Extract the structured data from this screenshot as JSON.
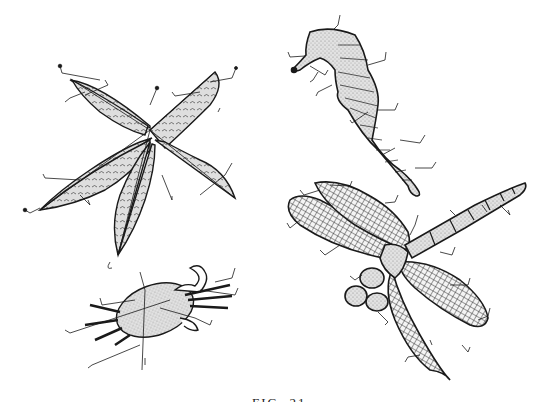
{
  "plate": {
    "description": "Engraved natural-history style plate with four specimens and leader lines",
    "figures": [
      {
        "id": "leaf",
        "label": "Sweetgum leaf (star-shaped, five-lobed)"
      },
      {
        "id": "seahorse",
        "label": "Seahorse"
      },
      {
        "id": "crab",
        "label": "Crab"
      },
      {
        "id": "dragonfly",
        "label": "Dragonfly"
      }
    ],
    "caption": "FIG. 21",
    "colors": {
      "ink": "#1a1a1a",
      "stipple": "#d8d8d8",
      "paper": "#ffffff"
    }
  }
}
